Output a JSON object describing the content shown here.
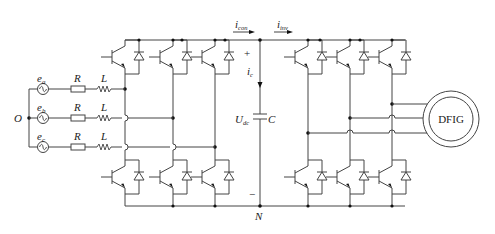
{
  "diagram": {
    "sources": [
      {
        "label": "e",
        "sub": "a",
        "resistor": "R",
        "inductor": "L"
      },
      {
        "label": "e",
        "sub": "b",
        "resistor": "R",
        "inductor": "L"
      },
      {
        "label": "e",
        "sub": "c",
        "resistor": "R",
        "inductor": "L"
      }
    ],
    "neutral_source": "O",
    "dc_link": {
      "current_converter": {
        "label": "i",
        "sub": "con"
      },
      "current_inverter": {
        "label": "i",
        "sub": "inv"
      },
      "capacitor_current": {
        "label": "i",
        "sub": "c"
      },
      "voltage": {
        "label": "U",
        "sub": "dc"
      },
      "capacitor": "C",
      "plus": "+",
      "minus": "−",
      "negative_node": "N"
    },
    "machine": "DFIG",
    "colors": {
      "wire": "#444444",
      "node": "#111111",
      "background": "#ffffff"
    }
  }
}
